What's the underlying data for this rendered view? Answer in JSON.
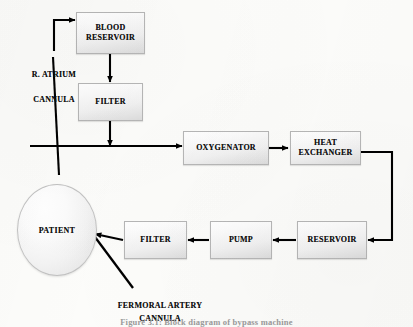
{
  "figure": {
    "caption": "Figure 3.1: Block diagram of bypass machine",
    "background_color": "#fcfcfa",
    "line_color": "#000000",
    "box_border_color": "#b6b6b6"
  },
  "nodes": {
    "blood_reservoir": {
      "label": "BLOOD\nRESERVOIR",
      "shape": "rectangle"
    },
    "filter_top": {
      "label": "FILTER",
      "shape": "rectangle"
    },
    "oxygenator": {
      "label": "OXYGENATOR",
      "shape": "rectangle"
    },
    "heat_exchanger": {
      "label": "HEAT\nEXCHANGER",
      "shape": "rectangle"
    },
    "reservoir": {
      "label": "RESERVOIR",
      "shape": "rectangle"
    },
    "pump": {
      "label": "PUMP",
      "shape": "rectangle"
    },
    "filter_bottom": {
      "label": "FILTER",
      "shape": "rectangle"
    },
    "patient": {
      "label": "PATIENT",
      "shape": "ellipse"
    }
  },
  "annotations": {
    "right_atrium_cannula": "R. ATRIUM\n\nCANNULA",
    "femoral_artery_cannula": "FERMORAL ARTERY\nCANNULA"
  },
  "flow": {
    "edges": [
      {
        "from": "right_atrium_cannula",
        "to": "blood_reservoir"
      },
      {
        "from": "blood_reservoir",
        "to": "filter_top"
      },
      {
        "from": "filter_top",
        "to": "oxygenator"
      },
      {
        "from": "oxygenator",
        "to": "heat_exchanger"
      },
      {
        "from": "heat_exchanger",
        "to": "reservoir"
      },
      {
        "from": "reservoir",
        "to": "pump"
      },
      {
        "from": "pump",
        "to": "filter_bottom"
      },
      {
        "from": "filter_bottom",
        "to": "patient"
      },
      {
        "from": "patient",
        "to": "right_atrium_cannula"
      }
    ]
  }
}
